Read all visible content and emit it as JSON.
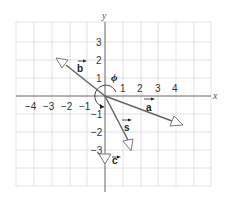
{
  "diagram": {
    "axes": {
      "x_label": "x",
      "y_label": "y",
      "x_ticks": [
        "−4",
        "−3",
        "−2",
        "−1",
        "1",
        "2",
        "3",
        "4"
      ],
      "y_ticks": [
        "3",
        "2",
        "1",
        "−1",
        "−2",
        "−3"
      ]
    },
    "angle_label": "ϕ",
    "vectors": [
      {
        "name": "a",
        "label": "a",
        "end": [
          4,
          -1.5
        ]
      },
      {
        "name": "b",
        "label": "b",
        "end": [
          -2.5,
          2
        ]
      },
      {
        "name": "s",
        "label": "s",
        "end": [
          1.5,
          -3
        ]
      },
      {
        "name": "c",
        "label": "c",
        "end": [
          0,
          -3.5
        ]
      }
    ],
    "colors": {
      "grid": "#d8d8d8",
      "axis": "#555555",
      "vector_stroke": "#555555",
      "arrowhead_fill": "#ffffff"
    }
  }
}
